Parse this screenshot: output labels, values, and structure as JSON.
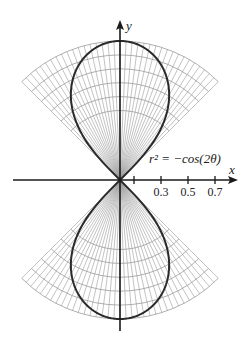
{
  "figure": {
    "equation_label": "r² = −cos(2θ)",
    "x_axis_label": "x",
    "y_axis_label": "y",
    "tick_labels": [
      "0.3",
      "0.5",
      "0.7"
    ]
  },
  "chart_data": {
    "type": "line",
    "title": "",
    "curve": "r^2 = -cos(2theta)",
    "annotation": "r² = −cos(2θ)",
    "xlabel": "x",
    "ylabel": "y",
    "x_ticks": [
      0.1,
      0.3,
      0.5,
      0.7
    ],
    "x_tick_labels": [
      "",
      "0.3",
      "0.5",
      "0.7"
    ],
    "xlim": [
      -0.8,
      0.85
    ],
    "ylim": [
      -1.1,
      1.2
    ],
    "grid": "polar sectors 45°–135° and 225°–315°, r from 0 to 1",
    "legend": "none",
    "colors": {
      "curve": "#2a2a2a",
      "grid": "#9a9a9a",
      "axes": "#1a1a1a"
    }
  }
}
